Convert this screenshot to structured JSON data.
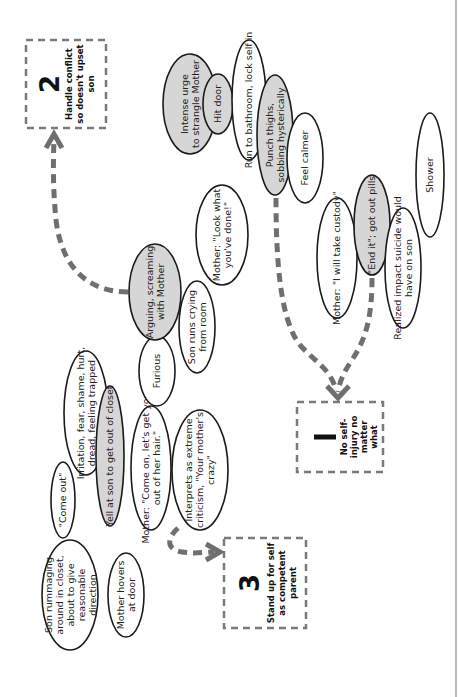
{
  "diagram": {
    "orientation": "rotated-90-ccw",
    "colors": {
      "highlight_fill": "#d6d6d6",
      "plain_fill": "#ffffff",
      "outline": "#1a1a1a",
      "dashed_arrow": "#6f6f6f",
      "box_border": "#7a7a7a"
    },
    "goals": [
      {
        "id": "goal-1",
        "number": "1",
        "lines": [
          "No self-",
          "injury no",
          "matter",
          "what"
        ]
      },
      {
        "id": "goal-2",
        "number": "2",
        "lines": [
          "Handle conflict",
          "so doesn't upset",
          "son"
        ]
      },
      {
        "id": "goal-3",
        "number": "3",
        "lines": [
          "Stand up for self",
          "as competent",
          "parent"
        ]
      }
    ],
    "nodes": [
      {
        "id": "son-rummaging",
        "highlighted": false,
        "lines": [
          "Son rummaging",
          "around in closet,",
          "about to give",
          "reasonable",
          "direction"
        ]
      },
      {
        "id": "mother-hovers",
        "highlighted": false,
        "lines": [
          "Mother hovers",
          "at door"
        ]
      },
      {
        "id": "come-out",
        "highlighted": false,
        "lines": [
          "\"Come out\""
        ]
      },
      {
        "id": "irritation",
        "highlighted": false,
        "lines": [
          "Irritation, fear, shame, hurt,",
          "dread, feeling trapped"
        ]
      },
      {
        "id": "yell-at-son",
        "highlighted": true,
        "lines": [
          "Yell at son to get out of closet"
        ]
      },
      {
        "id": "mother-come-on",
        "highlighted": false,
        "lines": [
          "Mother: \"Come on, let's get you",
          "out of her hair.\""
        ]
      },
      {
        "id": "interprets",
        "highlighted": false,
        "lines": [
          "Interprets as extreme",
          "criticism, \"Your mother's",
          "crazy\""
        ]
      },
      {
        "id": "furious",
        "highlighted": false,
        "lines": [
          "Furious"
        ]
      },
      {
        "id": "arguing",
        "highlighted": true,
        "lines": [
          "Arguing, screaming",
          "with Mother"
        ]
      },
      {
        "id": "son-runs-crying",
        "highlighted": false,
        "lines": [
          "Son runs crying",
          "from room"
        ]
      },
      {
        "id": "mother-look-what",
        "highlighted": false,
        "lines": [
          "Mother: \"Look what",
          "you've done!\""
        ]
      },
      {
        "id": "intense-urge",
        "highlighted": true,
        "lines": [
          "Intense urge",
          "to strangle Mother"
        ]
      },
      {
        "id": "hit-door",
        "highlighted": true,
        "lines": [
          "Hit door"
        ]
      },
      {
        "id": "run-to-bathroom",
        "highlighted": false,
        "lines": [
          "Run to bathroom, lock self in"
        ]
      },
      {
        "id": "punch-thighs",
        "highlighted": true,
        "lines": [
          "Punch thighs,",
          "sobbing hysterically"
        ]
      },
      {
        "id": "feel-calmer",
        "highlighted": false,
        "lines": [
          "Feel calmer"
        ]
      },
      {
        "id": "mother-custody",
        "highlighted": false,
        "lines": [
          "Mother: \"I will take custody\""
        ]
      },
      {
        "id": "end-it",
        "highlighted": true,
        "lines": [
          "\"End it\"; got out pills"
        ]
      },
      {
        "id": "realized-impact",
        "highlighted": false,
        "lines": [
          "Realized impact suicide would",
          "have on son"
        ]
      },
      {
        "id": "shower",
        "highlighted": false,
        "lines": [
          "Shower"
        ]
      }
    ],
    "arrows": [
      {
        "from": "arguing",
        "to": "goal-2"
      },
      {
        "from": "punch-thighs",
        "to": "goal-1"
      },
      {
        "from": "end-it",
        "to": "goal-1"
      },
      {
        "from": "interprets",
        "to": "goal-3"
      }
    ]
  }
}
